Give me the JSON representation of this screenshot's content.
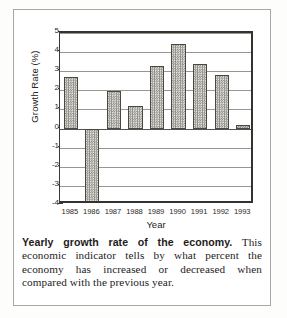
{
  "chart_data": {
    "type": "bar",
    "title": "",
    "xlabel": "Year",
    "ylabel": "Growth Rate (%)",
    "categories": [
      "1985",
      "1986",
      "1987",
      "1988",
      "1989",
      "1990",
      "1991",
      "1992",
      "1993"
    ],
    "values": [
      2.7,
      -3.9,
      1.95,
      1.2,
      3.25,
      4.45,
      3.4,
      2.8,
      0.2
    ],
    "ylim": [
      -4,
      5
    ],
    "yticks": [
      5,
      4,
      3,
      2,
      1,
      0,
      -1,
      -2,
      -3,
      -4
    ],
    "ytick_labels": [
      "5",
      "4",
      "3",
      "2",
      "1",
      "0",
      "-1",
      "-2",
      "-3",
      "-4"
    ],
    "grid": true,
    "legend": false,
    "bar_fill": "#cfcdc7",
    "bar_border": "#4a4843",
    "axis_color": "#35332f",
    "gridline_color": "#99968f"
  },
  "caption": {
    "lead": "Yearly growth rate of the economy.",
    "body": " This economic indicator tells by what percent the economy has increased or decreased when compared with the previous year."
  }
}
